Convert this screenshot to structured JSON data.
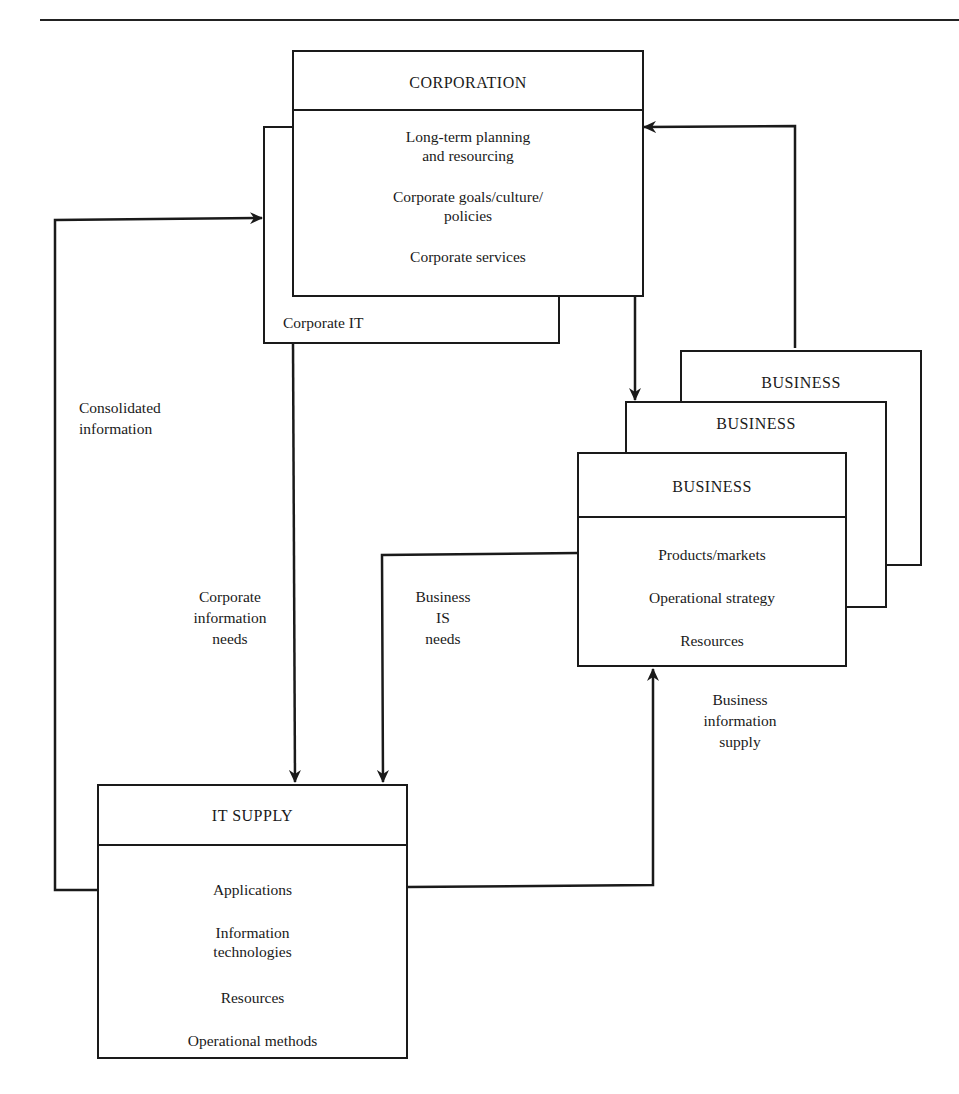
{
  "diagram": {
    "corporation": {
      "title": "CORPORATION",
      "items": [
        "Long-term planning\nand resourcing",
        "Corporate goals/culture/\npolicies",
        "Corporate services"
      ],
      "sub_unit": "Corporate IT"
    },
    "business_stack": {
      "back_title": "BUSINESS",
      "middle_title": "BUSINESS",
      "front": {
        "title": "BUSINESS",
        "items": [
          "Products/markets",
          "Operational strategy",
          "Resources"
        ]
      }
    },
    "it_supply": {
      "title": "IT SUPPLY",
      "items": [
        "Applications",
        "Information\ntechnologies",
        "Resources",
        "Operational methods"
      ]
    },
    "flows": {
      "consolidated_information": "Consolidated\ninformation",
      "corporate_information_needs": "Corporate\ninformation\nneeds",
      "business_is_needs": "Business\nIS\nneeds",
      "business_information_supply": "Business\ninformation\nsupply"
    },
    "colors": {
      "ink": "#1a1a1a",
      "background": "#ffffff"
    }
  }
}
